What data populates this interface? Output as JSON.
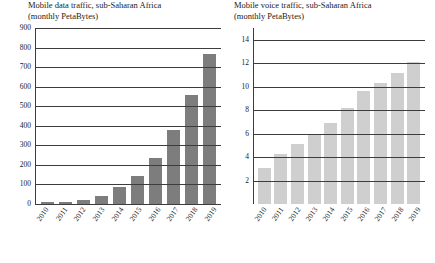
{
  "charts": {
    "left": {
      "title_line1": "Mobile data traffic, sub-Saharan Africa",
      "title_line2": "(monthly PetaBytes)"
    },
    "right": {
      "title_line1": "Mobile voice traffic, sub-Saharan Africa",
      "title_line2": "(monthly PetaBytes)"
    }
  },
  "chart_data": [
    {
      "type": "bar",
      "title": "Mobile data traffic, sub-Saharan Africa (monthly PetaBytes)",
      "xlabel": "",
      "ylabel": "",
      "categories": [
        "2010",
        "2011",
        "2012",
        "2013",
        "2014",
        "2015",
        "2016",
        "2017",
        "2018",
        "2019"
      ],
      "values": [
        8,
        12,
        20,
        40,
        85,
        145,
        235,
        380,
        560,
        765
      ],
      "ylim": [
        0,
        900
      ],
      "yticks": [
        0,
        100,
        200,
        300,
        400,
        500,
        600,
        700,
        800,
        900
      ],
      "grid": true,
      "legend": "none",
      "bar_color": "#7d7d7d"
    },
    {
      "type": "bar",
      "title": "Mobile voice traffic, sub-Saharan Africa (monthly PetaBytes)",
      "xlabel": "",
      "ylabel": "",
      "categories": [
        "2010",
        "2011",
        "2012",
        "2013",
        "2014",
        "2015",
        "2016",
        "2017",
        "2018",
        "2019"
      ],
      "values": [
        3.1,
        4.3,
        5.1,
        6.0,
        6.9,
        8.2,
        9.6,
        10.3,
        11.2,
        12.1
      ],
      "ylim": [
        0,
        15
      ],
      "yticks": [
        2,
        4,
        6,
        8,
        10,
        12,
        14
      ],
      "grid": true,
      "legend": "none",
      "bar_color": "#cfcfcf"
    }
  ]
}
